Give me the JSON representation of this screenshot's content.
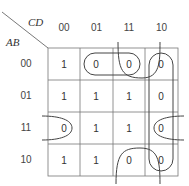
{
  "diagram": {
    "type": "karnaugh-map",
    "col_var": "CD",
    "row_var": "AB",
    "columns": [
      "00",
      "01",
      "11",
      "10"
    ],
    "rows": [
      {
        "label": "00",
        "cells": [
          "1",
          "0",
          "0",
          "0"
        ]
      },
      {
        "label": "01",
        "cells": [
          "1",
          "1",
          "1",
          "0"
        ]
      },
      {
        "label": "11",
        "cells": [
          "0",
          "1",
          "1",
          "0"
        ]
      },
      {
        "label": "10",
        "cells": [
          "1",
          "1",
          "0",
          "0"
        ]
      }
    ],
    "groupings": [
      "row 00, columns 01-11 (pair)",
      "column 11, rows 00 and 10 wrap (pair)",
      "column 10, all rows (quad)",
      "row 11, columns 00 and 10 wrap (pair)"
    ]
  }
}
